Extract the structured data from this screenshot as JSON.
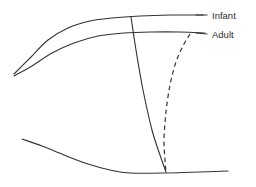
{
  "figure": {
    "background_color": "#ffffff",
    "stroke_color": "#333333",
    "width": 256,
    "height": 187
  },
  "labels": {
    "infant": "Infant",
    "adult": "Adult"
  },
  "chart_data": {
    "type": "line",
    "title": "",
    "xlabel": "",
    "ylabel": "",
    "grid": false,
    "legend_position": "right-inline-labels",
    "xlim": [
      0,
      256
    ],
    "ylim": [
      187,
      0
    ],
    "series": [
      {
        "name": "Infant",
        "style": "solid",
        "label": "Infant",
        "label_x": 212,
        "label_y": 16,
        "points": [
          [
            14,
            74
          ],
          [
            30,
            58
          ],
          [
            48,
            40
          ],
          [
            68,
            28
          ],
          [
            90,
            21
          ],
          [
            112,
            18
          ],
          [
            140,
            16
          ],
          [
            170,
            15
          ],
          [
            203,
            15
          ]
        ]
      },
      {
        "name": "Adult",
        "style": "solid",
        "label": "Adult",
        "label_x": 212,
        "label_y": 35,
        "points": [
          [
            14,
            76
          ],
          [
            32,
            66
          ],
          [
            52,
            53
          ],
          [
            74,
            43
          ],
          [
            98,
            36
          ],
          [
            124,
            33
          ],
          [
            152,
            32
          ],
          [
            180,
            32
          ],
          [
            205,
            33
          ]
        ]
      },
      {
        "name": "infant-descending-limb",
        "style": "solid",
        "label": "",
        "points": [
          [
            131,
            17
          ],
          [
            136,
            50
          ],
          [
            143,
            90
          ],
          [
            152,
            130
          ],
          [
            160,
            155
          ],
          [
            166,
            172
          ]
        ]
      },
      {
        "name": "adult-descending-limb",
        "style": "dashed",
        "label": "",
        "points": [
          [
            190,
            34
          ],
          [
            183,
            46
          ],
          [
            176,
            62
          ],
          [
            170,
            85
          ],
          [
            166,
            112
          ],
          [
            164,
            140
          ],
          [
            165,
            160
          ],
          [
            166,
            172
          ]
        ]
      },
      {
        "name": "lower-baseline-curve",
        "style": "solid",
        "label": "",
        "points": [
          [
            22,
            139
          ],
          [
            42,
            146
          ],
          [
            64,
            155
          ],
          [
            88,
            164
          ],
          [
            110,
            170
          ],
          [
            130,
            173
          ],
          [
            166,
            173
          ],
          [
            200,
            172
          ],
          [
            228,
            171
          ]
        ]
      }
    ],
    "leaders": [
      {
        "name": "infant-leader",
        "from": [
          196,
          15
        ],
        "to": [
          207,
          15
        ]
      },
      {
        "name": "adult-leader",
        "from": [
          196,
          33
        ],
        "to": [
          207,
          34
        ]
      }
    ]
  }
}
